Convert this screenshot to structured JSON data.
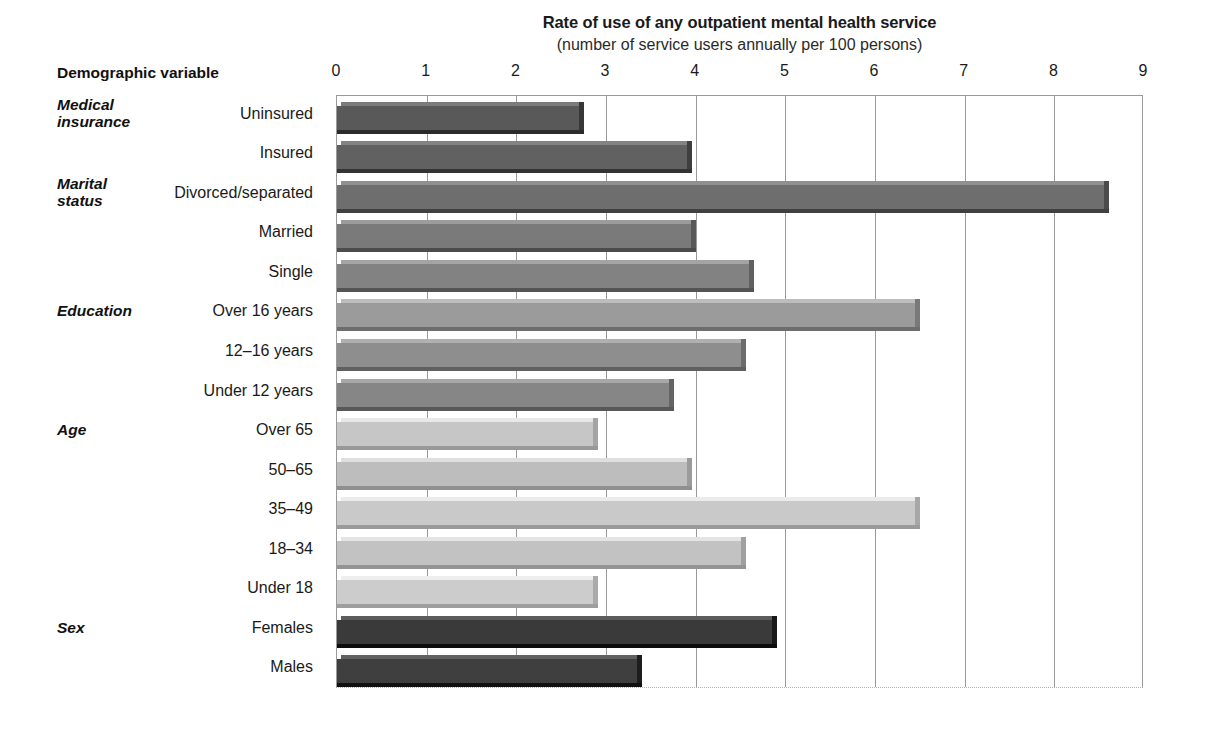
{
  "chart_data": {
    "type": "bar",
    "orientation": "horizontal",
    "title": "Rate of use of any outpatient mental health service",
    "subtitle": "(number of service users annually per 100 persons)",
    "xlabel": "",
    "ylabel": "Demographic variable",
    "xlim": [
      0,
      9
    ],
    "xticks": [
      0,
      1,
      2,
      3,
      4,
      5,
      6,
      7,
      8,
      9
    ],
    "xtick_labels": [
      "0",
      "1",
      "2",
      "3",
      "4",
      "5",
      "6",
      "7",
      "8",
      "9"
    ],
    "grid": true,
    "legend": false,
    "categories": [
      "Uninsured",
      "Insured",
      "Divorced/separated",
      "Married",
      "Single",
      "Over 16 years",
      "12–16 years",
      "Under 12 years",
      "Over 65",
      "50–65",
      "35–49",
      "18–34",
      "Under 18",
      "Females",
      "Males"
    ],
    "values": [
      2.7,
      3.9,
      8.55,
      3.95,
      4.6,
      6.45,
      4.5,
      3.7,
      2.85,
      3.9,
      6.45,
      4.5,
      2.85,
      4.85,
      3.35
    ],
    "bar_colors": [
      "#595959",
      "#616161",
      "#6e6e6e",
      "#7a7a7a",
      "#828282",
      "#9b9b9b",
      "#8e8e8e",
      "#868686",
      "#c6c6c6",
      "#bdbdbd",
      "#c9c9c9",
      "#c2c2c2",
      "#cccccc",
      "#3a3a3a",
      "#3f3f3f"
    ],
    "groups": [
      {
        "label": "Medical\ninsurance",
        "line1": "Medical",
        "line2": "insurance",
        "start_index": 0,
        "count": 2
      },
      {
        "label": "Marital\nstatus",
        "line1": "Marital",
        "line2": "status",
        "start_index": 2,
        "count": 3
      },
      {
        "label": "Education",
        "line1": "Education",
        "line2": "",
        "start_index": 5,
        "count": 3
      },
      {
        "label": "Age",
        "line1": "Age",
        "line2": "",
        "start_index": 8,
        "count": 5
      },
      {
        "label": "Sex",
        "line1": "Sex",
        "line2": "",
        "start_index": 13,
        "count": 2
      }
    ]
  },
  "axis_header": "Demographic variable"
}
